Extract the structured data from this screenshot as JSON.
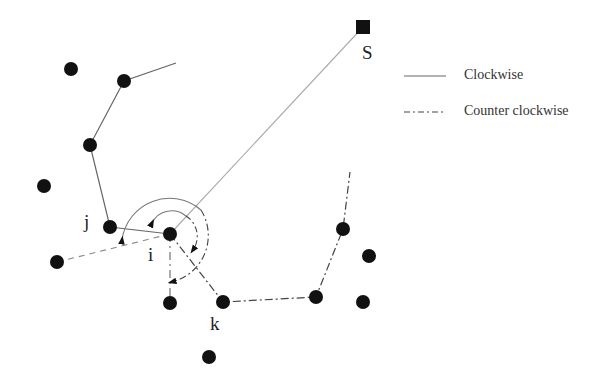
{
  "diagram": {
    "title": "",
    "labels": {
      "source": "S",
      "node_i": "i",
      "node_j": "j",
      "node_k": "k"
    },
    "legend": {
      "items": [
        {
          "label": "Clockwise",
          "style": "solid"
        },
        {
          "label": "Counter clockwise",
          "style": "dash-dot"
        }
      ]
    },
    "colors": {
      "node": "#111111",
      "solid_line": "#666666",
      "light_line": "#aaaaaa",
      "dashdot_line": "#444444"
    },
    "nodes": [
      {
        "id": "S",
        "x": 363,
        "y": 27,
        "shape": "square"
      },
      {
        "id": "i",
        "x": 170,
        "y": 234
      },
      {
        "id": "j",
        "x": 110,
        "y": 227
      },
      {
        "id": "k",
        "x": 223,
        "y": 302
      },
      {
        "id": "n1",
        "x": 124,
        "y": 81
      },
      {
        "id": "n2",
        "x": 90,
        "y": 145
      },
      {
        "id": "n3",
        "x": 71,
        "y": 69
      },
      {
        "id": "n4",
        "x": 44,
        "y": 186
      },
      {
        "id": "n5",
        "x": 57,
        "y": 262
      },
      {
        "id": "n6",
        "x": 170,
        "y": 303
      },
      {
        "id": "n7",
        "x": 209,
        "y": 357
      },
      {
        "id": "n8",
        "x": 343,
        "y": 229
      },
      {
        "id": "n9",
        "x": 369,
        "y": 256
      },
      {
        "id": "n10",
        "x": 316,
        "y": 297
      },
      {
        "id": "n11",
        "x": 363,
        "y": 302
      }
    ]
  }
}
